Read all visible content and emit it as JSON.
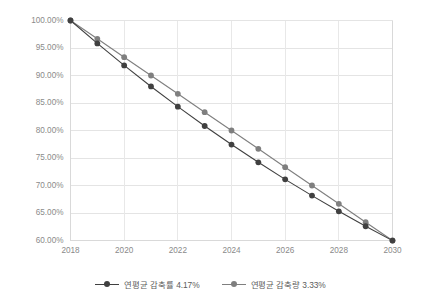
{
  "chart_data": {
    "type": "line",
    "title": "",
    "subtitle": "",
    "xlabel": "",
    "ylabel": "",
    "grid": true,
    "legend_position": "bottom",
    "x": [
      2018,
      2019,
      2020,
      2021,
      2022,
      2023,
      2024,
      2025,
      2026,
      2027,
      2028,
      2029,
      2030
    ],
    "xlim": [
      2018,
      2030
    ],
    "ylim": [
      0.6,
      1.0
    ],
    "xtick_labels": [
      "2018",
      "2020",
      "2022",
      "2024",
      "2026",
      "2028",
      "2030"
    ],
    "xticks": [
      2018,
      2020,
      2022,
      2024,
      2026,
      2028,
      2030
    ],
    "ytick_labels": [
      "100.00%",
      "95.00%",
      "90.00%",
      "85.00%",
      "80.00%",
      "75.00%",
      "70.00%",
      "65.00%",
      "60.00%"
    ],
    "yticks": [
      1.0,
      0.95,
      0.9,
      0.85,
      0.8,
      0.75,
      0.7,
      0.65,
      0.6
    ],
    "series": [
      {
        "name": "연평균 감축률 4.17%",
        "color": "#404040",
        "marker": "circle",
        "values": [
          1.0,
          0.9583,
          0.9183,
          0.8801,
          0.8434,
          0.8082,
          0.7745,
          0.7422,
          0.7112,
          0.6816,
          0.6531,
          0.6259,
          0.5998
        ]
      },
      {
        "name": "연평균 감축량 3.33%",
        "color": "#7f7f7f",
        "marker": "circle",
        "values": [
          1.0,
          0.9667,
          0.9333,
          0.9,
          0.8667,
          0.8333,
          0.8,
          0.7667,
          0.7333,
          0.7,
          0.6667,
          0.6333,
          0.6
        ]
      }
    ]
  },
  "legend": {
    "items": [
      {
        "label": "연평균 감축률 4.17%",
        "color": "#404040"
      },
      {
        "label": "연평균 감축량 3.33%",
        "color": "#7f7f7f"
      }
    ]
  },
  "colors": {
    "series_1": "#404040",
    "series_2": "#7f7f7f",
    "grid": "#e4e4e4",
    "tick_text": "#8a8a8a",
    "legend_text": "#5c5c5c",
    "background": "#ffffff"
  }
}
